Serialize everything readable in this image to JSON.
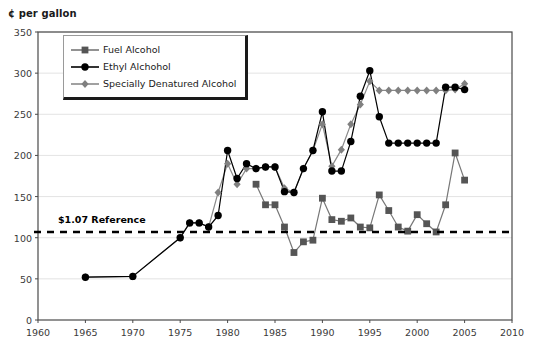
{
  "chart_data": {
    "type": "line",
    "title": "",
    "ylabel": "¢ per gallon",
    "xlabel": "",
    "xlim": [
      1960,
      2010
    ],
    "ylim": [
      0,
      350
    ],
    "yticks": [
      0,
      50,
      100,
      150,
      200,
      250,
      300,
      350
    ],
    "xticks": [
      1960,
      1965,
      1970,
      1975,
      1980,
      1985,
      1990,
      1995,
      2000,
      2005,
      2010
    ],
    "grid": true,
    "legend_position": "upper-left",
    "annotations": [
      {
        "name": "reference-line",
        "label": "$1.07 Reference",
        "value": 107,
        "style": "dashed-horizontal",
        "color": "#000000"
      }
    ],
    "series": [
      {
        "name": "Fuel Alcohol",
        "marker": "square",
        "color": "#555555",
        "line_color": "#777777",
        "x": [
          1983,
          1984,
          1985,
          1986,
          1987,
          1988,
          1989,
          1990,
          1991,
          1992,
          1993,
          1994,
          1995,
          1996,
          1997,
          1998,
          1999,
          2000,
          2001,
          2002,
          2003,
          2004,
          2005
        ],
        "y": [
          165,
          140,
          140,
          113,
          82,
          95,
          97,
          148,
          122,
          120,
          124,
          113,
          112,
          152,
          133,
          113,
          108,
          128,
          117,
          107,
          140,
          203,
          170
        ]
      },
      {
        "name": "Ethyl Alchohol",
        "marker": "circle",
        "color": "#000000",
        "line_color": "#000000",
        "x": [
          1965,
          1970,
          1975,
          1976,
          1977,
          1978,
          1979,
          1980,
          1981,
          1982,
          1983,
          1984,
          1985,
          1986,
          1987,
          1988,
          1989,
          1990,
          1991,
          1992,
          1993,
          1994,
          1995,
          1996,
          1997,
          1998,
          1999,
          2000,
          2001,
          2002,
          2003,
          2004,
          2005
        ],
        "y": [
          52,
          53,
          100,
          118,
          118,
          113,
          127,
          206,
          172,
          190,
          184,
          186,
          186,
          156,
          155,
          184,
          206,
          253,
          181,
          181,
          217,
          272,
          303,
          247,
          215,
          215,
          215,
          215,
          215,
          215,
          283,
          283,
          280
        ]
      },
      {
        "name": "Specially Denatured Alcohol",
        "marker": "diamond",
        "color": "#808080",
        "line_color": "#8a8a8a",
        "x": [
          1965,
          1970,
          1975,
          1976,
          1977,
          1978,
          1979,
          1980,
          1981,
          1982,
          1983,
          1984,
          1985,
          1986,
          1987,
          1988,
          1989,
          1990,
          1991,
          1992,
          1993,
          1994,
          1995,
          1996,
          1997,
          1998,
          1999,
          2000,
          2001,
          2002,
          2003,
          2004,
          2005
        ],
        "y": [
          52,
          53,
          100,
          118,
          118,
          113,
          155,
          190,
          165,
          184,
          184,
          186,
          186,
          160,
          155,
          184,
          206,
          238,
          187,
          207,
          238,
          262,
          290,
          279,
          279,
          279,
          279,
          279,
          279,
          279,
          279,
          280,
          287
        ]
      }
    ]
  },
  "legend": {
    "items": [
      {
        "label": "Fuel Alcohol",
        "marker": "square"
      },
      {
        "label": "Ethyl Alchohol",
        "marker": "circle"
      },
      {
        "label": "Specially Denatured Alcohol",
        "marker": "diamond"
      }
    ]
  },
  "colors": {
    "fuel_alcohol": "#555555",
    "ethyl_alcohol": "#000000",
    "specially_denatured": "#808080",
    "reference": "#000000",
    "axis": "#4a4a4a",
    "grid": "#dcdcdc"
  }
}
